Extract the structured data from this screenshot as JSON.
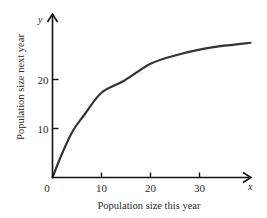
{
  "chart_data": {
    "type": "line",
    "title": "",
    "xlabel": "Population size this year",
    "ylabel": "Population size next year",
    "x_axis_symbol": "x",
    "y_axis_symbol": "y",
    "origin_label": "0",
    "x_ticks": [
      10,
      20,
      30
    ],
    "y_ticks": [
      10,
      20
    ],
    "xlim": [
      0,
      42
    ],
    "ylim": [
      0,
      33
    ],
    "grid": false,
    "legend": null,
    "series": [
      {
        "name": "Population growth curve",
        "x": [
          0,
          2,
          4.2,
          6.5,
          10,
          14.7,
          20,
          25,
          30,
          35,
          40.4
        ],
        "y": [
          0,
          5,
          9.6,
          12.8,
          17.3,
          19.8,
          23.2,
          24.9,
          26.1,
          26.9,
          27.5
        ]
      }
    ],
    "colors": {
      "axis": "#111111",
      "curve": "#333333",
      "text": "#2a2a2a"
    }
  }
}
